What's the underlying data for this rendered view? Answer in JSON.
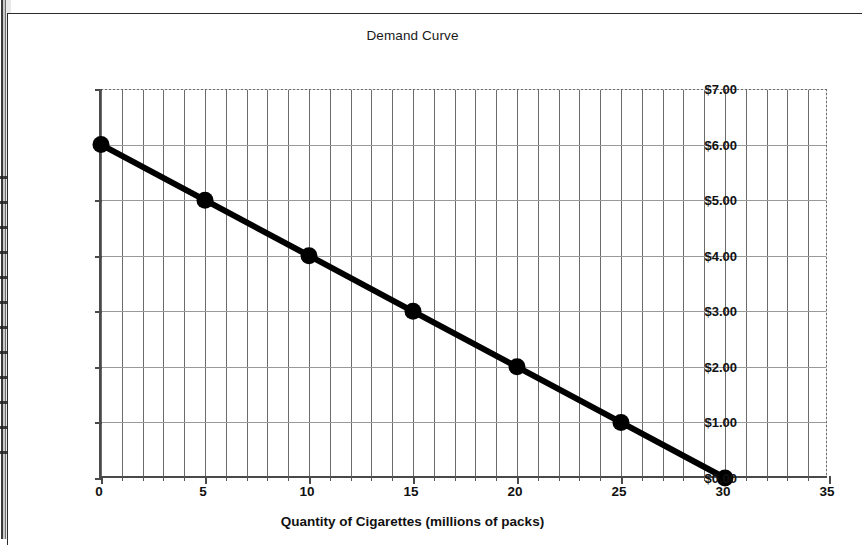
{
  "chart_data": {
    "type": "line",
    "title": "Demand Curve",
    "xlabel": "Quantity of Cigarettes (millions of packs)",
    "ylabel": "Price of Cigarettes ($/pack)",
    "xlim": [
      0,
      35
    ],
    "ylim": [
      0,
      7
    ],
    "grid": true,
    "legend": "none",
    "x_tick_labels": [
      "0",
      "5",
      "10",
      "15",
      "20",
      "25",
      "30",
      "35"
    ],
    "x_tick_values": [
      0,
      5,
      10,
      15,
      20,
      25,
      30,
      35
    ],
    "x_minor_tick_interval": 1,
    "y_tick_labels": [
      "$0.00",
      "$1.00",
      "$2.00",
      "$3.00",
      "$4.00",
      "$5.00",
      "$6.00",
      "$7.00"
    ],
    "y_tick_values": [
      0,
      1,
      2,
      3,
      4,
      5,
      6,
      7
    ],
    "series": [
      {
        "name": "Demand",
        "color": "#000000",
        "marker": "filled-circle",
        "x": [
          0,
          5,
          10,
          15,
          20,
          25,
          30
        ],
        "y": [
          6.0,
          5.0,
          4.0,
          3.0,
          2.0,
          1.0,
          0.0
        ],
        "points": [
          {
            "x": 0,
            "y": 6.0,
            "label": "$6.00"
          },
          {
            "x": 5,
            "y": 5.0,
            "label": "$5.00"
          },
          {
            "x": 10,
            "y": 4.0,
            "label": "$4.00"
          },
          {
            "x": 15,
            "y": 3.0,
            "label": "$3.00"
          },
          {
            "x": 20,
            "y": 2.0,
            "label": "$2.00"
          },
          {
            "x": 25,
            "y": 1.0,
            "label": "$1.00"
          },
          {
            "x": 30,
            "y": 0.0,
            "label": "$0.00"
          }
        ]
      }
    ]
  },
  "colors": {
    "series": "#000000",
    "gridline_vertical": "#6b6b6b",
    "gridline_horizontal": "#9a9a9a",
    "axis": "#4a4a4a",
    "frame": "#2b2b2b",
    "background": "#ffffff"
  }
}
